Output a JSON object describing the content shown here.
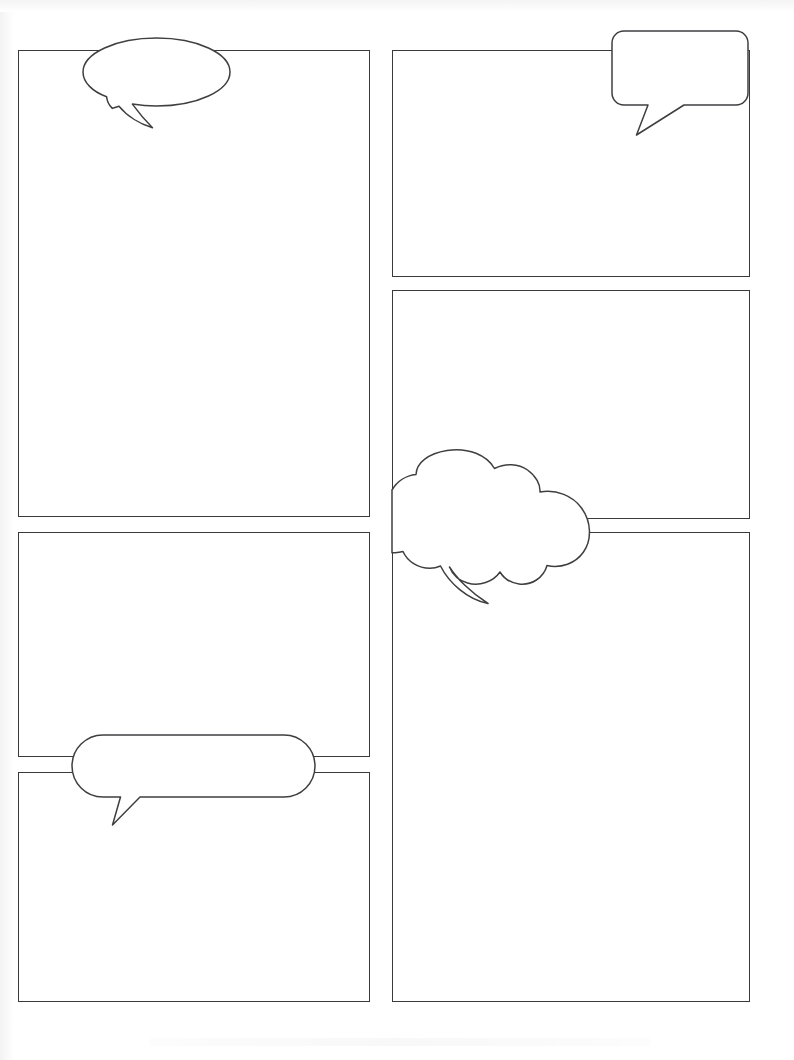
{
  "page": {
    "width": 794,
    "height": 1060,
    "background_color": "#ffffff",
    "ink_color": "#3a3a3c",
    "panel_border_width": 1.6
  },
  "panels": [
    {
      "id": "panel-1",
      "column": "left",
      "order": 1,
      "x": 18,
      "y": 50,
      "width": 352,
      "height": 467,
      "content": ""
    },
    {
      "id": "panel-2",
      "column": "left",
      "order": 2,
      "x": 18,
      "y": 532,
      "width": 352,
      "height": 225,
      "content": ""
    },
    {
      "id": "panel-3",
      "column": "left",
      "order": 3,
      "x": 18,
      "y": 772,
      "width": 352,
      "height": 230,
      "content": ""
    },
    {
      "id": "panel-4",
      "column": "right",
      "order": 1,
      "x": 392,
      "y": 50,
      "width": 358,
      "height": 227,
      "content": ""
    },
    {
      "id": "panel-5",
      "column": "right",
      "order": 2,
      "x": 392,
      "y": 290,
      "width": 358,
      "height": 229,
      "content": ""
    },
    {
      "id": "panel-6",
      "column": "right",
      "order": 3,
      "x": 392,
      "y": 532,
      "width": 358,
      "height": 470,
      "content": ""
    }
  ],
  "bubbles": [
    {
      "id": "bubble-oval",
      "shape": "oval",
      "label": "oval speech bubble",
      "attached_panel": "panel-1",
      "tail_direction": "down-left",
      "x": 83,
      "y": 38,
      "width": 147,
      "height": 68,
      "text": ""
    },
    {
      "id": "bubble-rounded-rect",
      "shape": "rounded-rectangle",
      "label": "rounded rectangle speech bubble",
      "attached_panel": "panel-4",
      "tail_direction": "down-left",
      "x": 612,
      "y": 31,
      "width": 136,
      "height": 74,
      "text": ""
    },
    {
      "id": "bubble-cloud",
      "shape": "cloud",
      "label": "cloud thought bubble",
      "attached_panel": "panel-5",
      "tail_direction": "down-left",
      "x": 392,
      "y": 450,
      "width": 200,
      "height": 110,
      "text": ""
    },
    {
      "id": "bubble-pill",
      "shape": "pill",
      "label": "pill speech bubble",
      "attached_panel": "panel-2",
      "tail_direction": "down-left",
      "x": 72,
      "y": 735,
      "width": 243,
      "height": 62,
      "text": ""
    }
  ]
}
